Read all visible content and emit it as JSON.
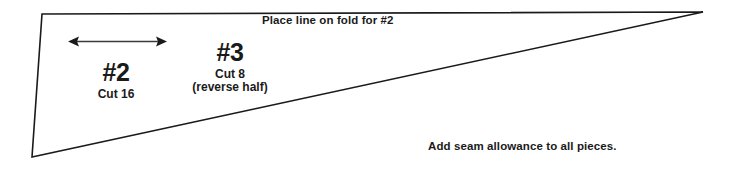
{
  "diagram": {
    "background_color": "#ffffff",
    "line_color": "#1a1a1a",
    "shape": {
      "name": "wedge-quadrilateral",
      "vertices": "42,14 703,12 32,157"
    },
    "arrow": {
      "name": "width-measure-arrow",
      "orientation": "horizontal",
      "double_headed": true
    },
    "fold_note": "Place line on fold for #2",
    "seam_note": "Add seam allowance to all pieces.",
    "pieces": [
      {
        "number": "#2",
        "cut": "Cut 16",
        "sub": ""
      },
      {
        "number": "#3",
        "cut": "Cut 8",
        "sub": "(reverse half)"
      }
    ]
  }
}
